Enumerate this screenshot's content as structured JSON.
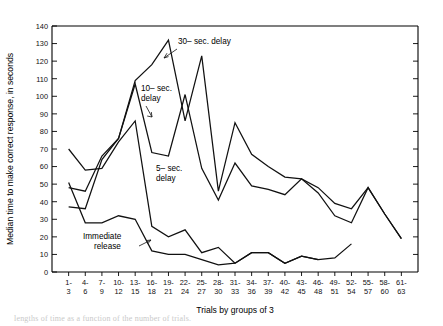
{
  "chart_data": {
    "type": "line",
    "title": "",
    "xlabel": "Trials by groups of 3",
    "ylabel": "Median time to make correct response, in seconds",
    "ylim": [
      0,
      140
    ],
    "ytick_step": 10,
    "yticks": [
      0,
      10,
      20,
      30,
      40,
      50,
      60,
      70,
      80,
      90,
      100,
      110,
      120,
      130,
      140
    ],
    "grid": false,
    "legend_position": "inline-annotations",
    "categories": [
      "1-\n3",
      "4-\n6",
      "7-\n9",
      "10-\n12",
      "13-\n15",
      "16-\n18",
      "19-\n21",
      "22-\n24",
      "25-\n27",
      "28-\n30",
      "31-\n33",
      "34-\n36",
      "37-\n39",
      "40-\n42",
      "43-\n45",
      "46-\n48",
      "49-\n51",
      "52-\n54",
      "55-\n57",
      "58-\n60",
      "61-\n63"
    ],
    "categories_top": [
      "1-",
      "4-",
      "7-",
      "10-",
      "13-",
      "16-",
      "19-",
      "22-",
      "25-",
      "28-",
      "31-",
      "34-",
      "37-",
      "40-",
      "43-",
      "46-",
      "49-",
      "52-",
      "55-",
      "58-",
      "61-"
    ],
    "categories_bottom": [
      "3",
      "6",
      "9",
      "12",
      "15",
      "18",
      "21",
      "24",
      "27",
      "30",
      "33",
      "36",
      "39",
      "42",
      "45",
      "48",
      "51",
      "54",
      "57",
      "60",
      "63"
    ],
    "series": [
      {
        "name": "30-sec. delay",
        "values": [
          37,
          36,
          64,
          76,
          109,
          118,
          132,
          86,
          123,
          46,
          85,
          67,
          60,
          54,
          53,
          48,
          39,
          36,
          48,
          33,
          19
        ]
      },
      {
        "name": "10-sec. delay",
        "values": [
          48,
          46,
          66,
          76,
          107,
          68,
          66,
          101,
          59,
          41,
          62,
          49,
          47,
          44,
          53,
          45,
          32,
          28,
          48,
          33,
          19
        ]
      },
      {
        "name": "5-sec. delay",
        "values": [
          70,
          58,
          59,
          74,
          86,
          26,
          20,
          24,
          11,
          14,
          5,
          11,
          11,
          5,
          9,
          7,
          null,
          null,
          null,
          null,
          null
        ]
      },
      {
        "name": "Immediate release",
        "values": [
          51,
          28,
          28,
          32,
          30,
          12,
          10,
          10,
          7,
          4,
          5,
          11,
          11,
          5,
          9,
          7,
          8,
          16,
          null,
          null,
          null
        ]
      }
    ],
    "annotations": [
      {
        "label": "30-sec. delay",
        "lines": [
          "30- sec. delay"
        ]
      },
      {
        "label": "10-sec. delay",
        "lines": [
          "10- sec.",
          "delay"
        ]
      },
      {
        "label": "5-sec. delay",
        "lines": [
          "5- sec.",
          "delay"
        ]
      },
      {
        "label": "Immediate release",
        "lines": [
          "Immediate",
          "release"
        ]
      }
    ],
    "colors": {
      "line": "#111111",
      "axis": "#000000",
      "background": "#ffffff"
    }
  },
  "axis": {
    "y_title": "Median time to make correct response, in seconds",
    "x_title": "Trials by groups of 3"
  },
  "annotations": {
    "thirty_sec": "30– sec. delay",
    "ten_sec_line1": "10– sec.",
    "ten_sec_line2": "delay",
    "five_sec_line1": "5– sec.",
    "five_sec_line2": "delay",
    "immediate_line1": "Immediate",
    "immediate_line2": "release"
  },
  "caption": {
    "partial_text": "lengths of time as a function of the number of trials."
  }
}
